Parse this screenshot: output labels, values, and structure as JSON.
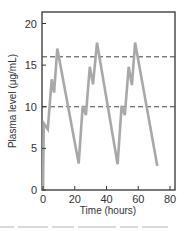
{
  "chart_data": {
    "type": "line",
    "title": "",
    "xlabel": "Time (hours)",
    "ylabel": "Plasma level (μg/mL)",
    "xlim": [
      0,
      85
    ],
    "ylim": [
      0,
      21.5
    ],
    "x_ticks": [
      0,
      20,
      40,
      60,
      80
    ],
    "y_ticks": [
      0,
      5,
      10,
      15,
      20
    ],
    "x_tick_labels": [
      "0",
      "20",
      "40",
      "60",
      "80"
    ],
    "y_tick_labels": [
      "0",
      "5",
      "10",
      "15",
      "20"
    ],
    "grid": false,
    "legend": null,
    "reference_lines": [
      {
        "axis": "y",
        "value": 16,
        "style": "dashed",
        "color": "#444444"
      },
      {
        "axis": "y",
        "value": 10,
        "style": "dashed",
        "color": "#444444"
      }
    ],
    "series": [
      {
        "name": "Plasma level",
        "color": "#a8a8a8",
        "points": [
          [
            0,
            0
          ],
          [
            0.5,
            8.0
          ],
          [
            3,
            7.3
          ],
          [
            5.5,
            13.3
          ],
          [
            7,
            11.7
          ],
          [
            9,
            17.0
          ],
          [
            22.5,
            3.2
          ],
          [
            25,
            10.1
          ],
          [
            27,
            9.0
          ],
          [
            29.5,
            14.8
          ],
          [
            31.5,
            12.7
          ],
          [
            34,
            17.7
          ],
          [
            47,
            3.1
          ],
          [
            49.5,
            10.1
          ],
          [
            51.5,
            9.0
          ],
          [
            54,
            14.8
          ],
          [
            56,
            12.6
          ],
          [
            58,
            17.7
          ],
          [
            72,
            2.9
          ]
        ]
      }
    ]
  },
  "plot": {
    "x_title": "Time (hours)",
    "y_title": "Plasma level (μg/mL)",
    "x_ticks": [
      "0",
      "20",
      "40",
      "60",
      "80"
    ],
    "y_ticks": [
      "0",
      "5",
      "10",
      "15",
      "20"
    ]
  }
}
